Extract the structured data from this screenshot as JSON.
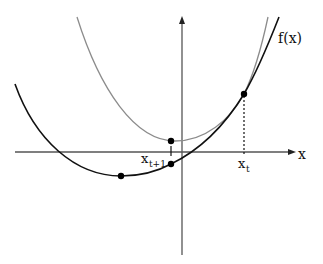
{
  "diagram": {
    "labels": {
      "function": "f(x)",
      "x_axis": "x",
      "x_t": "x",
      "x_t_sub": "t",
      "x_t1": "x",
      "x_t1_sub": "t+1"
    },
    "colors": {
      "function_curve": "#111111",
      "surrogate_curve": "#8c8c8c",
      "axes": "#555555",
      "points": "#000000"
    },
    "points": [
      {
        "name": "minimum-of-f",
        "x": 121,
        "y": 176
      },
      {
        "name": "surrogate-minimum",
        "x": 171,
        "y": 141
      },
      {
        "name": "f-at-x-t1",
        "x": 171,
        "y": 164
      },
      {
        "name": "tangent-point-x-t",
        "x": 244,
        "y": 94
      }
    ]
  }
}
